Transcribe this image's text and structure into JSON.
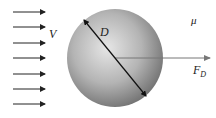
{
  "diagram": {
    "labels": {
      "velocity": "V",
      "diameter": "D",
      "viscosity": "μ",
      "force_main": "F",
      "force_sub": "D"
    },
    "flow_arrows": {
      "count": 7,
      "y_positions": [
        12,
        27,
        43,
        58,
        74,
        89,
        104
      ],
      "x_start": 13,
      "x_end": 45,
      "color": "#222222"
    },
    "sphere": {
      "cx": 115,
      "cy": 58,
      "r": 49,
      "highlight_color": "#e6e6e6",
      "mid_color": "#b4b4b4",
      "shadow_color": "#6e6e6e"
    },
    "diameter_line": {
      "x1": 84,
      "y1": 20,
      "x2": 146,
      "y2": 96,
      "color": "#111111"
    },
    "force_arrow": {
      "x1": 115,
      "y1": 58,
      "x2": 210,
      "y2": 58,
      "color": "#777777"
    }
  }
}
